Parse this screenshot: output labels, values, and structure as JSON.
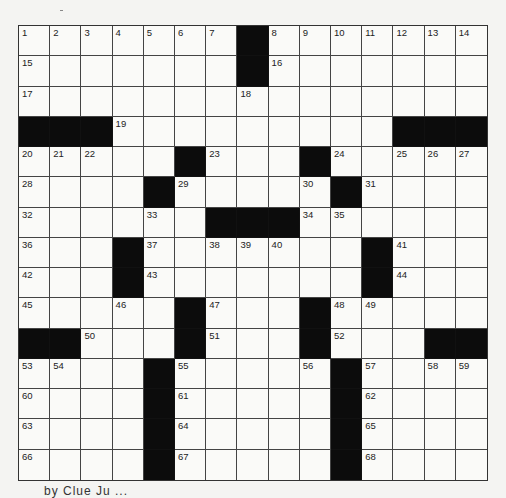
{
  "puzzle": {
    "size": 15,
    "grid": [
      [
        "1",
        "2",
        "3",
        "4",
        "5",
        "6",
        "7",
        "#",
        "8",
        "9",
        "10",
        "11",
        "12",
        "13",
        "14"
      ],
      [
        "15",
        "",
        "",
        "",
        "",
        "",
        "",
        "#",
        "16",
        "",
        "",
        "",
        "",
        "",
        ""
      ],
      [
        "17",
        "",
        "",
        "",
        "",
        "",
        "",
        "18",
        "",
        "",
        "",
        "",
        "",
        "",
        ""
      ],
      [
        "#",
        "#",
        "#",
        "19",
        "",
        "",
        "",
        "",
        "",
        "",
        "",
        "",
        "#",
        "#",
        "#"
      ],
      [
        "20",
        "21",
        "22",
        "",
        "",
        "#",
        "23",
        "",
        "",
        "#",
        "24",
        "",
        "25",
        "26",
        "27"
      ],
      [
        "28",
        "",
        "",
        "",
        "#",
        "29",
        "",
        "",
        "",
        "30",
        "#",
        "31",
        "",
        "",
        ""
      ],
      [
        "32",
        "",
        "",
        "",
        "33",
        "",
        "#",
        "#",
        "#",
        "34",
        "35",
        "",
        "",
        "",
        ""
      ],
      [
        "36",
        "",
        "",
        "#",
        "37",
        "",
        "38",
        "39",
        "40",
        "",
        "",
        "#",
        "41",
        "",
        ""
      ],
      [
        "42",
        "",
        "",
        "#",
        "43",
        "",
        "",
        "",
        "",
        "",
        "",
        "#",
        "44",
        "",
        ""
      ],
      [
        "45",
        "",
        "",
        "46",
        "",
        "#",
        "47",
        "",
        "",
        "#",
        "48",
        "49",
        "",
        "",
        ""
      ],
      [
        "#",
        "#",
        "50",
        "",
        "",
        "#",
        "51",
        "",
        "",
        "#",
        "52",
        "",
        "",
        "#",
        "#"
      ],
      [
        "53",
        "54",
        "",
        "",
        "#",
        "55",
        "",
        "",
        "",
        "56",
        "#",
        "57",
        "",
        "58",
        "59"
      ],
      [
        "60",
        "",
        "",
        "",
        "#",
        "61",
        "",
        "",
        "",
        "",
        "#",
        "62",
        "",
        "",
        ""
      ],
      [
        "63",
        "",
        "",
        "",
        "#",
        "64",
        "",
        "",
        "",
        "",
        "#",
        "65",
        "",
        "",
        ""
      ],
      [
        "66",
        "",
        "",
        "",
        "#",
        "67",
        "",
        "",
        "",
        "",
        "#",
        "68",
        "",
        "",
        ""
      ]
    ]
  },
  "footer": {
    "text": "by Clue Ju ..."
  }
}
